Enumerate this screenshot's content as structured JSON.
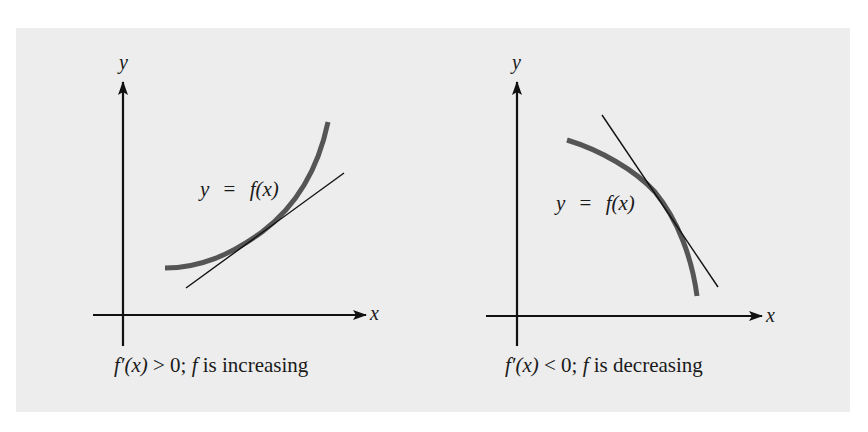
{
  "figure": {
    "background_color": "#ededed",
    "curve_color": "#555555",
    "line_color": "#111111",
    "panels": [
      {
        "id": "increasing",
        "y_axis_label": "y",
        "x_axis_label": "x",
        "curve_label": {
          "lhs": "y",
          "eq": "=",
          "rhs": "f(x)"
        },
        "caption": {
          "fprime": "f′(x)",
          "relation": ">",
          "value": "0;",
          "f": "f",
          "text": "is increasing"
        },
        "description": "Concave-up increasing curve with tangent line of positive slope"
      },
      {
        "id": "decreasing",
        "y_axis_label": "y",
        "x_axis_label": "x",
        "curve_label": {
          "lhs": "y",
          "eq": "=",
          "rhs": "f(x)"
        },
        "caption": {
          "fprime": "f′(x)",
          "relation": "<",
          "value": "0;",
          "f": "f",
          "text": "is decreasing"
        },
        "description": "Concave-down decreasing curve with tangent line of negative slope"
      }
    ]
  }
}
